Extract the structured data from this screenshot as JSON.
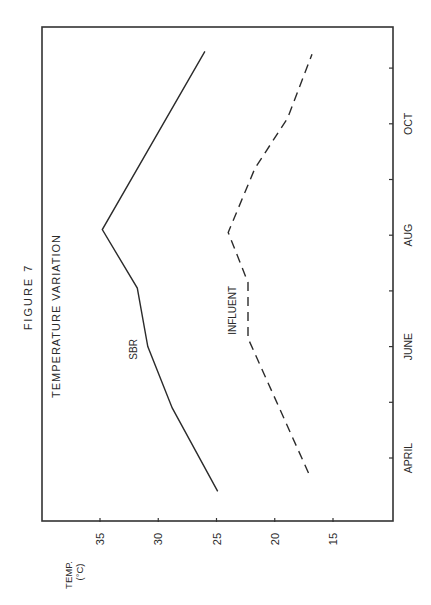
{
  "figure_label": "FIGURE 7",
  "chart_data": {
    "type": "line",
    "title": "TEMPERATURE VARIATION",
    "orientation_note": "rotated 90 degrees counter-clockwise",
    "xlabel": "",
    "ylabel": "TEMP.",
    "ylabel_unit": "(°C)",
    "x_axis": {
      "unit": "month index (0 = April)",
      "ticks": [
        0,
        1,
        2,
        3,
        4,
        5,
        6,
        7
      ],
      "tick_labels": [
        {
          "at": 0,
          "label": "APRIL"
        },
        {
          "at": 2,
          "label": "JUNE"
        },
        {
          "at": 4,
          "label": "AUG"
        },
        {
          "at": 6,
          "label": "OCT"
        }
      ],
      "range": [
        -1.2,
        8.0
      ]
    },
    "y_axis": {
      "ticks": [
        15,
        20,
        25,
        30,
        35
      ],
      "tick_labels": [
        "15",
        "20",
        "25",
        "30",
        "35"
      ],
      "range": [
        10.8,
        39.2
      ]
    },
    "grid": false,
    "series": [
      {
        "name": "SBR",
        "style": "solid",
        "points": [
          [
            -0.6,
            24.9
          ],
          [
            0.9,
            28.8
          ],
          [
            2.0,
            30.9
          ],
          [
            3.05,
            31.8
          ],
          [
            4.1,
            34.8
          ],
          [
            7.3,
            26.0
          ]
        ],
        "label_at": [
          1.95,
          31.8
        ]
      },
      {
        "name": "INFLUENT",
        "style": "dashed",
        "points": [
          [
            -0.27,
            17.1
          ],
          [
            2.15,
            22.3
          ],
          [
            3.15,
            22.3
          ],
          [
            4.05,
            24.0
          ],
          [
            5.2,
            21.7
          ],
          [
            6.1,
            18.9
          ],
          [
            7.25,
            16.8
          ]
        ],
        "label_at": [
          2.65,
          23.3
        ]
      }
    ]
  }
}
